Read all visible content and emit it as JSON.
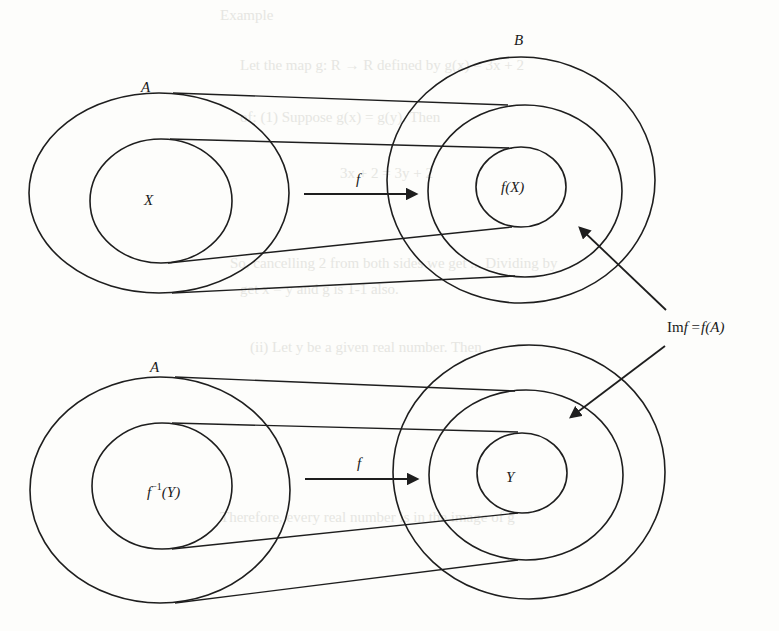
{
  "figure": {
    "colors": {
      "stroke": "#1e1e1e",
      "background": "#fdfdfb",
      "bleed_through_text": "#e6e6e2"
    }
  },
  "top_diagram": {
    "domain_label": "A",
    "codomain_label": "B",
    "subset_label": "X",
    "image_label": "f(X)",
    "map_label": "f"
  },
  "bottom_diagram": {
    "domain_label": "A",
    "preimage_label": "f⁻¹(Y)",
    "preimage_base": "f",
    "preimage_sup": "−1",
    "preimage_arg": "(Y)",
    "subset_label": "Y",
    "map_label": "f"
  },
  "annotation": {
    "label_prefix": "Im",
    "label_f": "f",
    "label_eq": " =",
    "label_rhs": "f(A)",
    "full_text": "Im f = f(A)"
  },
  "bleed_through": {
    "lines": [
      "Example",
      "Let the map g: R → R defined by g(x) = 3x + 2",
      "of: (1) Suppose g(x) = g(y). Then",
      "3x + 2 = 3y + 2",
      "So, cancelling 2 from both sides we get ... Dividing by",
      "get x = y and g is 1-1 also.",
      "(ii) Let y be a given real number. Then",
      "Therefore, every real number is in the image of g"
    ]
  }
}
